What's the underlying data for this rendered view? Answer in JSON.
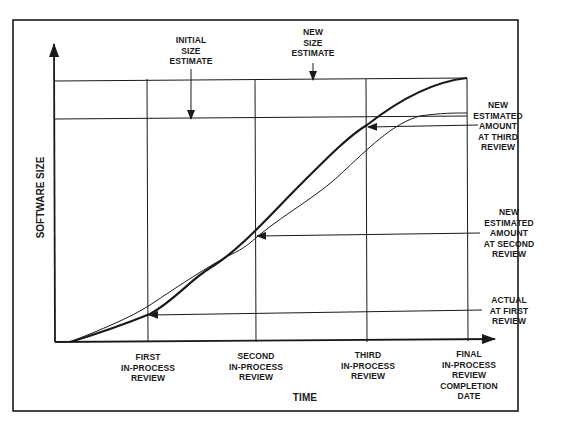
{
  "diagram": {
    "y_axis_label": "SOFTWARE SIZE",
    "x_axis_label": "TIME",
    "top_annotations": {
      "initial_size_estimate": "INITIAL\nSIZE\nESTIMATE",
      "new_size_estimate": "NEW\nSIZE\nESTIMATE"
    },
    "right_annotations": {
      "third_review": "NEW\nESTIMATED\nAMOUNT\nAT THIRD\nREVIEW",
      "second_review": "NEW\nESTIMATED\nAMOUNT\nAT SECOND\nREVIEW",
      "first_review": "ACTUAL\nAT FIRST\nREVIEW"
    },
    "x_ticks": [
      {
        "label": "FIRST\nIN-PROCESS\nREVIEW"
      },
      {
        "label": "SECOND\nIN-PROCESS\nREVIEW"
      },
      {
        "label": "THIRD\nIN-PROCESS\nREVIEW"
      },
      {
        "label": "FINAL\nIN-PROCESS\nREVIEW\nCOMPLETION\nDATE"
      }
    ],
    "curves": [
      {
        "name": "actual-growth-thick",
        "stroke_width": 2.2
      },
      {
        "name": "estimated-growth-thin",
        "stroke_width": 1
      }
    ],
    "colors": {
      "line": "#1a1a1a",
      "background": "#ffffff"
    }
  }
}
